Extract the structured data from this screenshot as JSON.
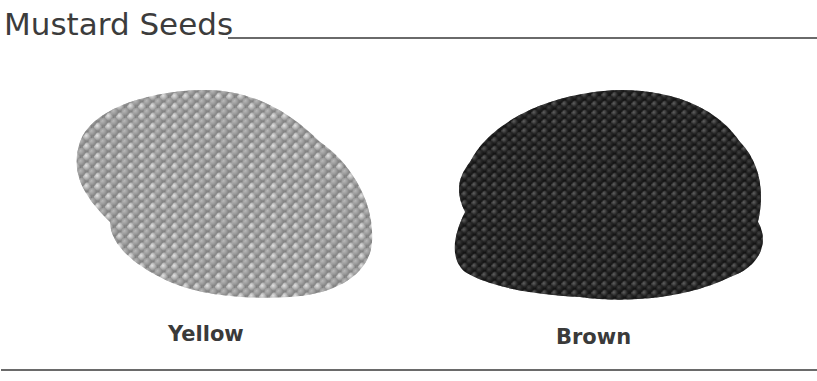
{
  "header": {
    "title": "Mustard Seeds"
  },
  "figures": [
    {
      "label": "Yellow",
      "image": "yellow-mustard-seed-pile",
      "tone": "#a9a9a9",
      "shadow": "#6f6f6f",
      "highlight": "#d6d6d6"
    },
    {
      "label": "Brown",
      "image": "brown-mustard-seed-pile",
      "tone": "#2b2b2b",
      "shadow": "#111111",
      "highlight": "#5a5a5a"
    }
  ],
  "colors": {
    "rule": "#6a6a6a",
    "text": "#3a3a3a",
    "background": "#ffffff"
  }
}
